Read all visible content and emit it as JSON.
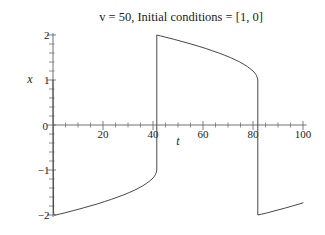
{
  "window": {
    "background": "#ffffff"
  },
  "chart_data": {
    "type": "line",
    "title": "v = 50, Initial conditions = [1, 0]",
    "xlabel": "t",
    "ylabel": "x",
    "xlim": [
      0,
      101
    ],
    "ylim": [
      -2,
      2
    ],
    "grid": false,
    "legend": "none",
    "origin_label": "0",
    "x_major_ticks": [
      20,
      40,
      60,
      80,
      100
    ],
    "x_tick_labels": [
      "20",
      "40",
      "60",
      "80",
      "100"
    ],
    "x_minor_step": 5,
    "y_major_ticks": [
      2,
      1,
      0,
      -1,
      -2
    ],
    "y_tick_labels": [
      "2",
      "1",
      "0",
      "−1",
      "−2"
    ],
    "y_minor_step": 0.2,
    "colors": {
      "curve": "#474747",
      "axis": "#717171",
      "text": "#1c1c1c",
      "background": "#ffffff"
    },
    "series": [
      {
        "name": "x(t)",
        "color": "#474747",
        "points": [
          [
            0,
            1.0
          ],
          [
            0.1,
            -1.0
          ],
          [
            0.2,
            -1.9
          ],
          [
            0.35,
            -2.0
          ],
          [
            1.1,
            -2.0
          ],
          [
            2.6,
            -1.98
          ],
          [
            4.8,
            -1.95
          ],
          [
            8.3,
            -1.9
          ],
          [
            11.6,
            -1.85
          ],
          [
            14.8,
            -1.8
          ],
          [
            17.9,
            -1.75
          ],
          [
            20.7,
            -1.7
          ],
          [
            23.4,
            -1.65
          ],
          [
            25.9,
            -1.6
          ],
          [
            28.3,
            -1.55
          ],
          [
            30.5,
            -1.5
          ],
          [
            32.5,
            -1.45
          ],
          [
            34.3,
            -1.4
          ],
          [
            35.9,
            -1.35
          ],
          [
            37.3,
            -1.3
          ],
          [
            38.5,
            -1.25
          ],
          [
            39.6,
            -1.2
          ],
          [
            40.4,
            -1.15
          ],
          [
            41.0,
            -1.1
          ],
          [
            41.3,
            -1.05
          ],
          [
            41.5,
            -1.0
          ],
          [
            41.5,
            2.0
          ],
          [
            43.0,
            1.98
          ],
          [
            45.2,
            1.95
          ],
          [
            48.7,
            1.9
          ],
          [
            52.0,
            1.85
          ],
          [
            55.2,
            1.8
          ],
          [
            58.3,
            1.75
          ],
          [
            61.1,
            1.7
          ],
          [
            63.8,
            1.65
          ],
          [
            66.3,
            1.6
          ],
          [
            68.7,
            1.55
          ],
          [
            70.9,
            1.5
          ],
          [
            72.9,
            1.45
          ],
          [
            74.7,
            1.4
          ],
          [
            76.3,
            1.35
          ],
          [
            77.7,
            1.3
          ],
          [
            78.9,
            1.25
          ],
          [
            80.0,
            1.2
          ],
          [
            80.8,
            1.15
          ],
          [
            81.4,
            1.1
          ],
          [
            81.7,
            1.05
          ],
          [
            81.9,
            1.0
          ],
          [
            81.9,
            -2.0
          ],
          [
            82.0,
            -2.0
          ],
          [
            83.5,
            -1.98
          ],
          [
            85.7,
            -1.95
          ],
          [
            89.2,
            -1.9
          ],
          [
            92.5,
            -1.85
          ],
          [
            95.7,
            -1.8
          ],
          [
            98.8,
            -1.75
          ],
          [
            100,
            -1.73
          ]
        ]
      }
    ]
  }
}
